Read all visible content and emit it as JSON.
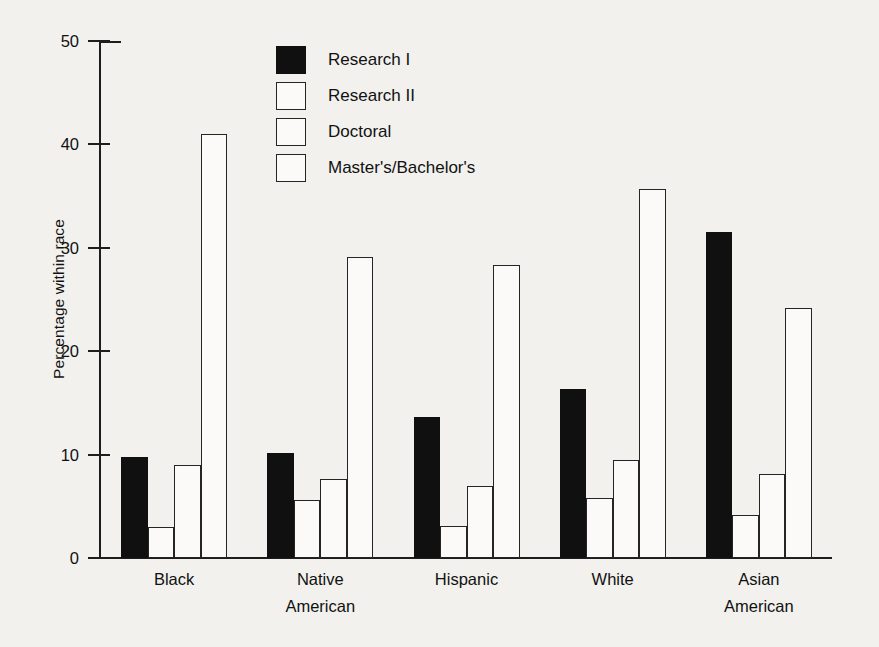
{
  "chart_data": {
    "type": "bar",
    "title": "",
    "xlabel": "",
    "ylabel": "Percentage within race",
    "ylim": [
      0,
      50
    ],
    "yticks": [
      0,
      10,
      20,
      30,
      40,
      50
    ],
    "ytick_labels": [
      "0",
      "10",
      "20",
      "30",
      "40",
      "50"
    ],
    "grid": false,
    "legend_position": "upper center",
    "categories": [
      "Black",
      "Native American",
      "Hispanic",
      "White",
      "Asian American"
    ],
    "category_lines": [
      [
        "Black"
      ],
      [
        "Native",
        "American"
      ],
      [
        "Hispanic"
      ],
      [
        "White"
      ],
      [
        "Asian",
        "American"
      ]
    ],
    "series": [
      {
        "name": "Research I",
        "style": "filled",
        "color": "#101010",
        "values": [
          9.8,
          10.2,
          13.6,
          16.3,
          31.5
        ]
      },
      {
        "name": "Research II",
        "style": "hollow",
        "color": "#ffffff",
        "values": [
          3.0,
          5.6,
          3.1,
          5.8,
          4.2
        ]
      },
      {
        "name": "Doctoral",
        "style": "hollow",
        "color": "#ffffff",
        "values": [
          9.0,
          7.6,
          7.0,
          9.5,
          8.1
        ]
      },
      {
        "name": "Master's/Bachelor's",
        "style": "hollow",
        "color": "#ffffff",
        "values": [
          41.0,
          29.1,
          28.3,
          35.7,
          24.2
        ]
      }
    ]
  }
}
